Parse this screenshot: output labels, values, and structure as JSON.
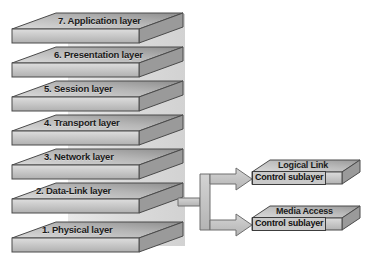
{
  "diagram": {
    "colors": {
      "slab_top_light": "#d8d8d8",
      "slab_top_dark": "#8f8f8f",
      "slab_front_light": "#d9d9d9",
      "slab_front_dark": "#b3b3b3",
      "slab_side": "#9a9a9a",
      "outline": "#4a4a4a",
      "band": "#dcdcdc",
      "arrow_fill": "#c6c6c6",
      "arrow_outline": "#6e6e6e",
      "label_box_fill": "#c9c9c9",
      "text": "#1b1b1b"
    },
    "layers": [
      {
        "label": "7. Application layer"
      },
      {
        "label": "6. Presentation layer"
      },
      {
        "label": "5. Session layer"
      },
      {
        "label": "4. Transport layer"
      },
      {
        "label": "3. Network layer"
      },
      {
        "label": "2. Data-Link layer"
      },
      {
        "label": "1. Physical layer"
      }
    ],
    "sublayers": [
      {
        "line1": "Logical Link",
        "line2": "Control sublayer"
      },
      {
        "line1": "Media Access",
        "line2": "Control sublayer"
      }
    ]
  }
}
